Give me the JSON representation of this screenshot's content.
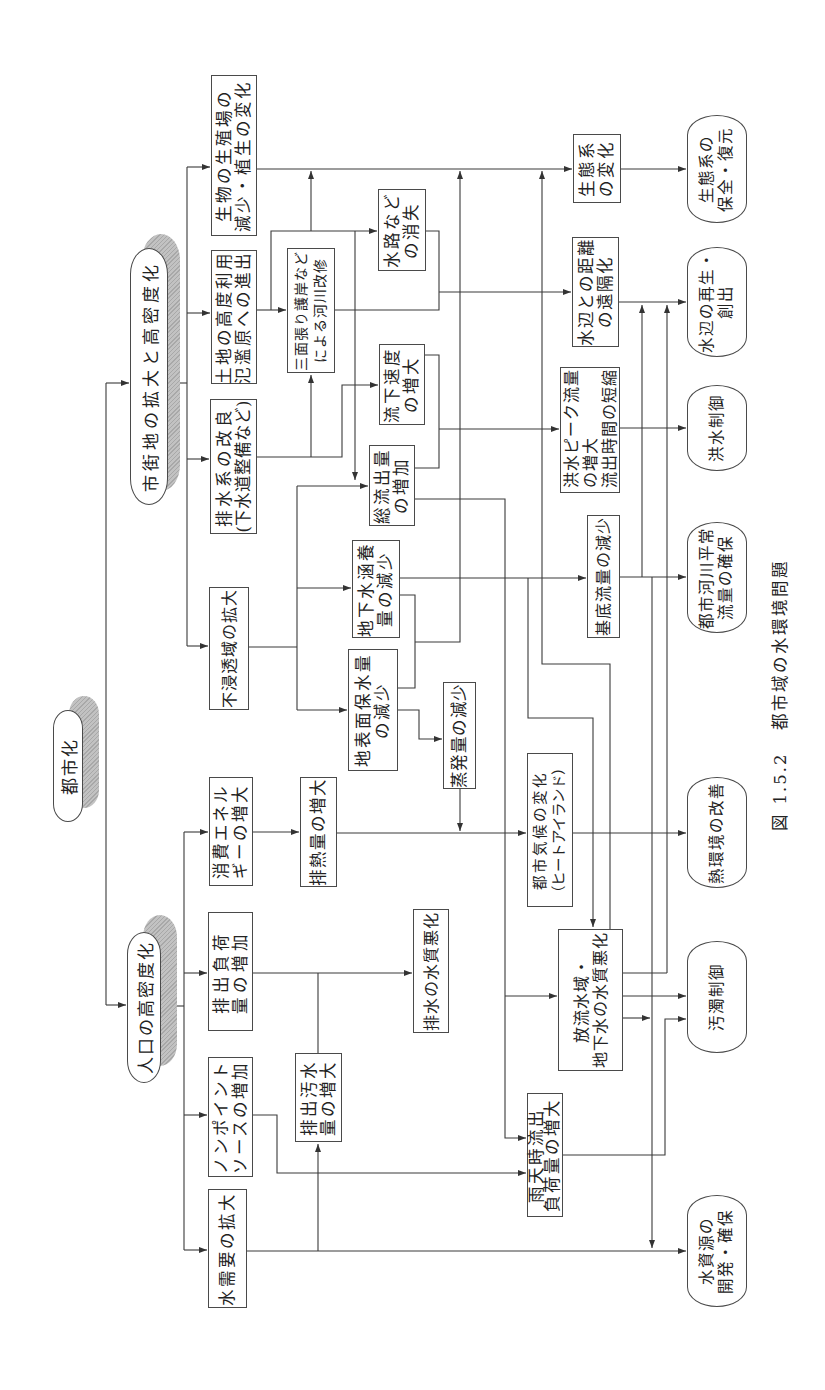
{
  "figure": {
    "number": "図 1.5.2",
    "title": "都市域の水環境問題"
  },
  "root": {
    "id": "toshika",
    "lines": [
      "都市化"
    ]
  },
  "groups": {
    "shigaichi": {
      "lines": [
        "市街地の拡大と高密度化"
      ]
    },
    "jinko": {
      "lines": [
        "人口の高密度化"
      ]
    }
  },
  "nodes": {
    "seibutsu": {
      "lines": [
        "生物の生殖場の",
        "減少・植生の変化"
      ]
    },
    "tochi": {
      "lines": [
        "土地の高度利用",
        "氾濫原への進出"
      ]
    },
    "haisuikei": {
      "lines": [
        "排水系の改良",
        "(下水道整備など)"
      ]
    },
    "fushinto": {
      "lines": [
        "不浸透域の拡大"
      ]
    },
    "sanmen": {
      "lines": [
        "三面張り護岸など",
        "による河川改修"
      ]
    },
    "suiro": {
      "lines": [
        "水路など",
        "の消失"
      ]
    },
    "ryuka": {
      "lines": [
        "流下速度",
        "の増大"
      ]
    },
    "soryushutsu": {
      "lines": [
        "総流出量",
        "の増加"
      ]
    },
    "chikasui": {
      "lines": [
        "地下水涵養",
        "量の減少"
      ]
    },
    "chihyomen": {
      "lines": [
        "地表面保水量",
        "の減少"
      ]
    },
    "johatsu": {
      "lines": [
        "蒸発量の減少"
      ]
    },
    "seitaikei_henka": {
      "lines": [
        "生態系",
        "の変化"
      ]
    },
    "mizube_kyori": {
      "lines": [
        "水辺との距離",
        "の遠隔化"
      ]
    },
    "kozui_peak": {
      "lines": [
        "洪水ピーク流量",
        "の増大",
        "流出時間の短縮"
      ]
    },
    "kitei": {
      "lines": [
        "基底流量の減少"
      ]
    },
    "toshikiko": {
      "lines": [
        "都市気候の変化",
        "（ヒートアイランド）"
      ]
    },
    "horyu": {
      "lines": [
        "放流水域・",
        "地下水の水質悪化"
      ]
    },
    "utenji": {
      "lines": [
        "雨天時流出",
        "負荷量の増大"
      ]
    },
    "shohi_energy": {
      "lines": [
        "消費エネル",
        "ギーの増大"
      ]
    },
    "haishutsu_fuka": {
      "lines": [
        "排出負荷",
        "量の増加"
      ]
    },
    "nonpoint": {
      "lines": [
        "ノンポイント",
        "ソースの増加"
      ]
    },
    "mizujuyo": {
      "lines": [
        "水需要の拡大"
      ]
    },
    "hainetsu": {
      "lines": [
        "排熱量の増大"
      ]
    },
    "haisui_suishitsu": {
      "lines": [
        "排水の水質悪化"
      ]
    },
    "haishutsu_osui": {
      "lines": [
        "排出汚水",
        "量の増大"
      ]
    }
  },
  "outcomes": {
    "seitaikei_hozen": {
      "lines": [
        "生態系の",
        "保全・復元"
      ]
    },
    "mizube_saisei": {
      "lines": [
        "水辺の再生・",
        "創出"
      ]
    },
    "kozui_seigyo": {
      "lines": [
        "洪水制御"
      ]
    },
    "toshikasen": {
      "lines": [
        "都市河川平常",
        "流量の確保"
      ]
    },
    "netsu_kankyo": {
      "lines": [
        "熱環境の改善"
      ]
    },
    "odaku_seigyo": {
      "lines": [
        "汚濁制御"
      ]
    },
    "mizushigen": {
      "lines": [
        "水資源の",
        "開発・確保"
      ]
    }
  },
  "edges": [
    [
      "toshika",
      "shigaichi"
    ],
    [
      "toshika",
      "jinko"
    ],
    [
      "shigaichi",
      "seibutsu"
    ],
    [
      "shigaichi",
      "tochi"
    ],
    [
      "shigaichi",
      "haisuikei"
    ],
    [
      "shigaichi",
      "fushinto"
    ],
    [
      "jinko",
      "shohi_energy"
    ],
    [
      "jinko",
      "haishutsu_fuka"
    ],
    [
      "jinko",
      "nonpoint"
    ],
    [
      "jinko",
      "mizujuyo"
    ],
    [
      "seibutsu",
      "seitaikei_henka"
    ],
    [
      "tochi",
      "sanmen"
    ],
    [
      "tochi",
      "suiro"
    ],
    [
      "tochi",
      "seitaikei_henka"
    ],
    [
      "tochi",
      "soryushutsu"
    ],
    [
      "haisuikei",
      "sanmen"
    ],
    [
      "haisuikei",
      "ryuka"
    ],
    [
      "fushinto",
      "soryushutsu"
    ],
    [
      "fushinto",
      "chikasui"
    ],
    [
      "fushinto",
      "chihyomen"
    ],
    [
      "sanmen",
      "mizube_kyori"
    ],
    [
      "suiro",
      "mizube_kyori"
    ],
    [
      "ryuka",
      "kozui_peak"
    ],
    [
      "soryushutsu",
      "kozui_peak"
    ],
    [
      "soryushutsu",
      "horyu"
    ],
    [
      "soryushutsu",
      "utenji"
    ],
    [
      "chikasui",
      "kitei"
    ],
    [
      "chikasui",
      "horyu"
    ],
    [
      "chikasui",
      "seitaikei_henka"
    ],
    [
      "chihyomen",
      "seitaikei_henka"
    ],
    [
      "chihyomen",
      "johatsu"
    ],
    [
      "johatsu",
      "toshikiko"
    ],
    [
      "shohi_energy",
      "hainetsu"
    ],
    [
      "hainetsu",
      "toshikiko"
    ],
    [
      "toshikiko",
      "netsu_kankyo"
    ],
    [
      "seitaikei_henka",
      "seitaikei_hozen"
    ],
    [
      "mizube_kyori",
      "mizube_saisei"
    ],
    [
      "kozui_peak",
      "kozui_seigyo"
    ],
    [
      "kitei",
      "toshikasen"
    ],
    [
      "kitei",
      "mizube_saisei"
    ],
    [
      "kitei",
      "mizushigen"
    ],
    [
      "horyu",
      "odaku_seigyo"
    ],
    [
      "horyu",
      "mizube_saisei"
    ],
    [
      "horyu",
      "mizushigen"
    ],
    [
      "horyu",
      "seitaikei_henka"
    ],
    [
      "utenji",
      "odaku_seigyo"
    ],
    [
      "nonpoint",
      "utenji"
    ],
    [
      "haishutsu_fuka",
      "haisui_suishitsu"
    ],
    [
      "haishutsu_osui",
      "haisui_suishitsu"
    ],
    [
      "mizujuyo",
      "mizushigen"
    ],
    [
      "mizujuyo",
      "haishutsu_osui"
    ]
  ],
  "colors": {
    "line": "#3a3a3a",
    "box_border": "#4a4a4a",
    "shadow": "#b8b8b8",
    "background": "#ffffff"
  }
}
